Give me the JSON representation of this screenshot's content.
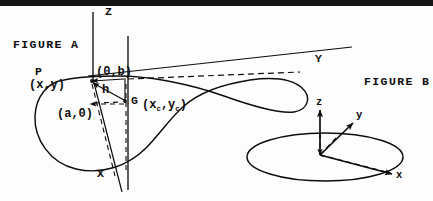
{
  "figure": {
    "top_rule_color": "#151515",
    "ink_color": "#0d0d0d",
    "background": "#fdfdfd"
  },
  "figure_a": {
    "title": "FIGURE A",
    "axes": {
      "z_label": "Z",
      "y_label": "Y",
      "x_label": "X"
    },
    "points": {
      "p_label": "P",
      "p_coords": "(x,y)",
      "origin_offset": "(0,b)",
      "a_coords": "(a,0)",
      "h_label": "h",
      "centroid_label": "G",
      "centroid_coords_open": "(x",
      "centroid_sub_1": "c",
      "centroid_coords_mid": ",y",
      "centroid_sub_2": "c",
      "centroid_coords_close": ")"
    }
  },
  "figure_b": {
    "title": "FIGURE B",
    "axes": {
      "z_label": "z",
      "y_label": "y",
      "x_label": "x"
    }
  }
}
